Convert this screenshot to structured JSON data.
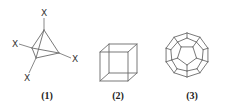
{
  "figures": [
    {
      "caption": "(1)",
      "shape": "tetrahedron",
      "substituent_label": "X",
      "substituent_count": 4
    },
    {
      "caption": "(2)",
      "shape": "cube"
    },
    {
      "caption": "(3)",
      "shape": "dodecahedron"
    }
  ]
}
